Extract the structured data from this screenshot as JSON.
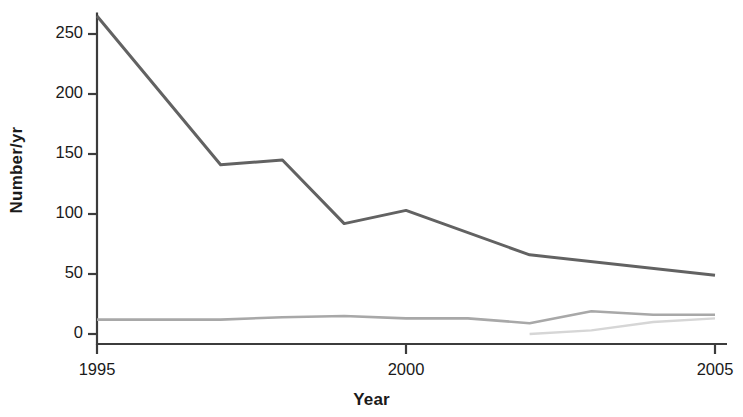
{
  "chart_data": {
    "type": "line",
    "title": "",
    "xlabel": "Year",
    "ylabel": "Number/yr",
    "xlim": [
      1995,
      2005
    ],
    "ylim": [
      0,
      268
    ],
    "grid": false,
    "legend": "none",
    "x": [
      1995,
      1996,
      1997,
      1998,
      1999,
      2000,
      2001,
      2002,
      2003,
      2004,
      2005
    ],
    "xticks": [
      1995,
      2000,
      2005
    ],
    "xticklabels": [
      "1995",
      "2000",
      "2005"
    ],
    "yticks": [
      0,
      50,
      100,
      150,
      200,
      250
    ],
    "yticklabels": [
      "0",
      "50",
      "100",
      "150",
      "200",
      "250"
    ],
    "series": [
      {
        "name": "dark-series",
        "color": "#626262",
        "width": 3.0,
        "x": [
          1995,
          1997,
          1998,
          1999,
          2000,
          2002,
          2005
        ],
        "values": [
          265,
          141,
          145,
          92,
          103,
          66,
          49
        ]
      },
      {
        "name": "mid-gray-series",
        "color": "#a8a8a8",
        "width": 2.6,
        "x": [
          1995,
          1997,
          1998,
          1999,
          2000,
          2001,
          2002,
          2003,
          2004,
          2005
        ],
        "values": [
          12,
          12,
          14,
          15,
          13,
          13,
          9,
          19,
          16,
          16
        ]
      },
      {
        "name": "light-gray-series",
        "color": "#d6d6d6",
        "width": 2.4,
        "x": [
          2002,
          2003,
          2004,
          2005
        ],
        "values": [
          0,
          3,
          10,
          13
        ]
      }
    ],
    "axis_color": "#3c3c3c"
  }
}
